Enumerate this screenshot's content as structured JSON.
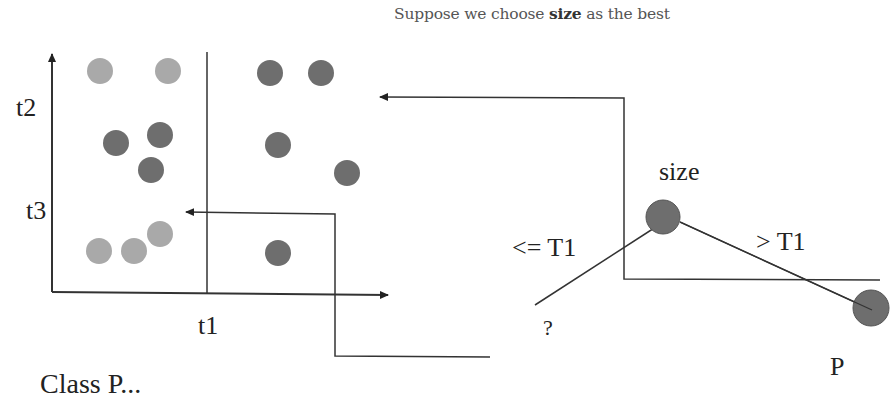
{
  "header": {
    "prefix": "Suppose we choose ",
    "emphasis": "size",
    "suffix": " as the best"
  },
  "scatter": {
    "x_axis_label": "t1",
    "y_labels": [
      "t2",
      "t3"
    ],
    "colors": {
      "light": "#a9a9a9",
      "dark": "#6e6e6e"
    },
    "points": [
      {
        "x": 100,
        "y": 71,
        "class": "light"
      },
      {
        "x": 168,
        "y": 71,
        "class": "light"
      },
      {
        "x": 270,
        "y": 73,
        "class": "dark"
      },
      {
        "x": 321,
        "y": 73,
        "class": "dark"
      },
      {
        "x": 116,
        "y": 143,
        "class": "dark"
      },
      {
        "x": 160,
        "y": 135,
        "class": "dark"
      },
      {
        "x": 151,
        "y": 170,
        "class": "dark"
      },
      {
        "x": 278,
        "y": 145,
        "class": "dark"
      },
      {
        "x": 347,
        "y": 173,
        "class": "dark"
      },
      {
        "x": 99,
        "y": 251,
        "class": "light"
      },
      {
        "x": 134,
        "y": 251,
        "class": "light"
      },
      {
        "x": 160,
        "y": 234,
        "class": "light"
      },
      {
        "x": 278,
        "y": 253,
        "class": "dark"
      }
    ]
  },
  "tree": {
    "root_label": "size",
    "left_edge_label": "<= T1",
    "right_edge_label": "> T1",
    "left_leaf_label": "?",
    "right_leaf_label": "P"
  },
  "caption": {
    "text": "Class P..."
  }
}
